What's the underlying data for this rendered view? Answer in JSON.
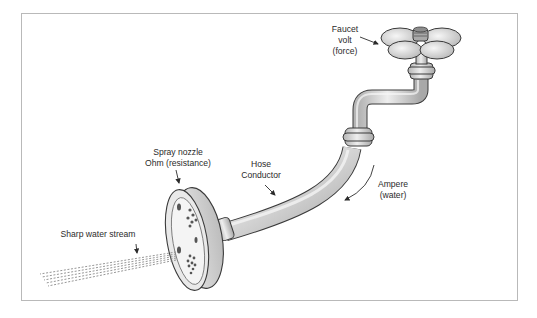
{
  "diagram": {
    "type": "water-hose electricity analogy illustration",
    "labels": {
      "faucet": {
        "line1": "Faucet",
        "line2": "volt",
        "line3": "(force)"
      },
      "nozzle": {
        "line1": "Spray nozzle",
        "line2": "Ohm (resistance)"
      },
      "hose": {
        "line1": "Hose",
        "line2": "Conductor"
      },
      "ampere": {
        "line1": "Ampere",
        "line2": "(water)"
      },
      "stream": {
        "line1": "Sharp water stream"
      }
    },
    "colors": {
      "frame_border": "#b9b9b9",
      "pipe_fill": "#d9d9d9",
      "pipe_shade": "#a8a8a8",
      "outline": "#3a3a3a",
      "text": "#2b2b2b"
    }
  }
}
